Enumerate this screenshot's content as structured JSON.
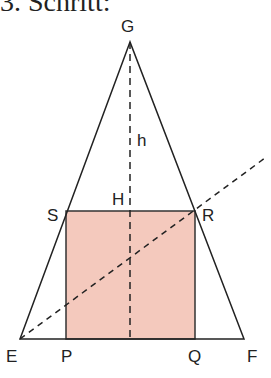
{
  "title": "3. Schritt:",
  "diagram": {
    "labels": {
      "G": "G",
      "h": "h",
      "H": "H",
      "S": "S",
      "R": "R",
      "E": "E",
      "P": "P",
      "Q": "Q",
      "F": "F"
    },
    "colors": {
      "square_fill": "#f4c9bd",
      "line": "#222222"
    },
    "points": {
      "G": [
        130,
        42
      ],
      "E": [
        20,
        339
      ],
      "F": [
        244,
        339
      ],
      "S": [
        66,
        211
      ],
      "R": [
        195,
        211
      ],
      "P": [
        66,
        339
      ],
      "Q": [
        195,
        339
      ],
      "dash_end": [
        265,
        158
      ]
    }
  }
}
